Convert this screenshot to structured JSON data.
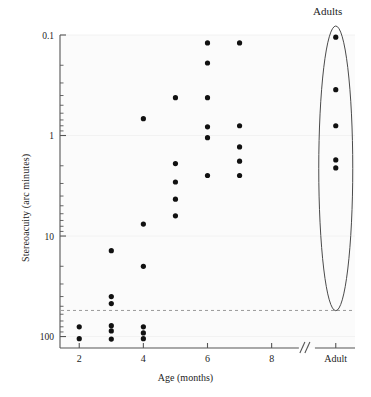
{
  "figure": {
    "kind": "scatter-plot",
    "background": "#ffffff",
    "point_color": "#111111",
    "axis_color": "#555555",
    "grid_color": "#f2f2f2",
    "reference_line_color": "#999999"
  },
  "chart_data": {
    "type": "scatter",
    "title": "",
    "xlabel": "Age (months)",
    "ylabel": "Stereoacuity (arc minutes)",
    "x_tick_labels": [
      "2",
      "4",
      "6",
      "8",
      "Adult"
    ],
    "x_tick_values": [
      2,
      4,
      6,
      8,
      10
    ],
    "xlim": [
      1.4,
      10.6
    ],
    "x_axis_break": true,
    "x_axis_break_label": "//",
    "y_tick_labels": [
      "0.1",
      "1",
      "10",
      "100"
    ],
    "y_tick_values": [
      0.1,
      1,
      10,
      100
    ],
    "ylim": [
      0.1,
      130
    ],
    "y_scale": "log-inverted",
    "grid": false,
    "legend": "none",
    "annotations": [
      {
        "name": "adults-group-label",
        "text": "Adults",
        "x": 10,
        "y": 0.08
      },
      {
        "name": "adult-group-ellipse",
        "shape": "ellipse",
        "cx": 10,
        "y_top": 0.1,
        "y_bottom": 45
      }
    ],
    "reference_line": {
      "style": "dashed",
      "y": 55,
      "label": ""
    },
    "series": [
      {
        "name": "stereoacuity-measurements",
        "points": [
          {
            "age": 2,
            "stereoacuity": 80
          },
          {
            "age": 2,
            "stereoacuity": 105
          },
          {
            "age": 3,
            "stereoacuity": 14
          },
          {
            "age": 3,
            "stereoacuity": 40
          },
          {
            "age": 3,
            "stereoacuity": 47
          },
          {
            "age": 3,
            "stereoacuity": 78
          },
          {
            "age": 3,
            "stereoacuity": 88
          },
          {
            "age": 3,
            "stereoacuity": 106
          },
          {
            "age": 4,
            "stereoacuity": 0.68
          },
          {
            "age": 4,
            "stereoacuity": 7.6
          },
          {
            "age": 4,
            "stereoacuity": 20
          },
          {
            "age": 4,
            "stereoacuity": 80
          },
          {
            "age": 4,
            "stereoacuity": 92
          },
          {
            "age": 4,
            "stereoacuity": 105
          },
          {
            "age": 5,
            "stereoacuity": 0.42
          },
          {
            "age": 5,
            "stereoacuity": 1.9
          },
          {
            "age": 5,
            "stereoacuity": 2.9
          },
          {
            "age": 5,
            "stereoacuity": 4.3
          },
          {
            "age": 5,
            "stereoacuity": 6.3
          },
          {
            "age": 6,
            "stereoacuity": 0.12
          },
          {
            "age": 6,
            "stereoacuity": 0.19
          },
          {
            "age": 6,
            "stereoacuity": 0.42
          },
          {
            "age": 6,
            "stereoacuity": 0.82
          },
          {
            "age": 6,
            "stereoacuity": 1.05
          },
          {
            "age": 6,
            "stereoacuity": 2.5
          },
          {
            "age": 7,
            "stereoacuity": 0.12
          },
          {
            "age": 7,
            "stereoacuity": 0.8
          },
          {
            "age": 7,
            "stereoacuity": 1.3
          },
          {
            "age": 7,
            "stereoacuity": 1.8
          },
          {
            "age": 7,
            "stereoacuity": 2.5
          },
          {
            "age": 10,
            "stereoacuity": 0.105
          },
          {
            "age": 10,
            "stereoacuity": 0.35
          },
          {
            "age": 10,
            "stereoacuity": 0.8
          },
          {
            "age": 10,
            "stereoacuity": 1.75
          },
          {
            "age": 10,
            "stereoacuity": 2.1
          }
        ]
      }
    ]
  }
}
